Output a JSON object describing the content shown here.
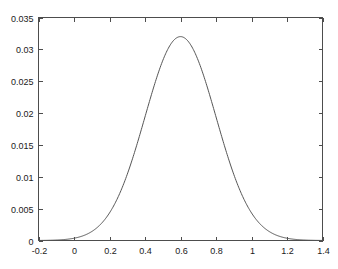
{
  "chart_data": {
    "type": "line",
    "title": "",
    "subtitle": "",
    "xlabel": "",
    "ylabel": "",
    "xlim": [
      -0.2,
      1.4
    ],
    "ylim": [
      0,
      0.035
    ],
    "grid": false,
    "legend": false,
    "legend_position": "none",
    "box": true,
    "tick_direction": "in",
    "line_color": "#555555",
    "axis_color": "#4d4d4d",
    "background_color": "#ffffff",
    "xticks": [
      -0.2,
      0,
      0.2,
      0.4,
      0.6,
      0.8,
      1,
      1.2,
      1.4
    ],
    "xticklabels": [
      "-0.2",
      "0",
      "0.2",
      "0.4",
      "0.6",
      "0.8",
      "1",
      "1.2",
      "1.4"
    ],
    "yticks": [
      0,
      0.005,
      0.01,
      0.015,
      0.02,
      0.025,
      0.03,
      0.035
    ],
    "yticklabels": [
      "0",
      "0.005",
      "0.01",
      "0.015",
      "0.02",
      "0.025",
      "0.03",
      "0.035"
    ],
    "series": [
      {
        "name": "gaussian",
        "peak_value": 0.032,
        "peak_x": 0.6,
        "sigma": 0.2,
        "x": [
          -0.2,
          -0.15,
          -0.1,
          -0.05,
          0.0,
          0.05,
          0.1,
          0.15,
          0.2,
          0.25,
          0.3,
          0.35,
          0.4,
          0.45,
          0.5,
          0.55,
          0.6,
          0.65,
          0.7,
          0.75,
          0.8,
          0.85,
          0.9,
          0.95,
          1.0,
          1.05,
          1.1,
          1.15,
          1.2,
          1.25,
          1.3,
          1.35,
          1.4
        ],
        "values": [
          2e-05,
          5e-05,
          0.00011,
          0.00024,
          0.00048,
          0.00092,
          0.00166,
          0.00283,
          0.00456,
          0.00693,
          0.00996,
          0.01353,
          0.01738,
          0.02111,
          0.02424,
          0.02634,
          0.02708,
          0.02634,
          0.02424,
          0.02111,
          0.01738,
          0.01353,
          0.00996,
          0.00693,
          0.00456,
          0.00283,
          0.00166,
          0.00092,
          0.00048,
          0.00024,
          0.00011,
          5e-05,
          2e-05
        ]
      }
    ]
  }
}
